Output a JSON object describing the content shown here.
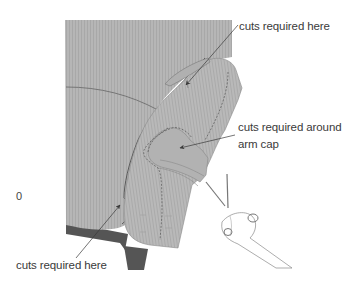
{
  "figure": {
    "colors": {
      "fabric": "#b4b4b4",
      "fabric_stripe": "#a6a6a6",
      "fabric_shadow": "#9c9c9c",
      "leg": "#5a5a5a",
      "seam": "#555555",
      "arrow": "#3a3a3a",
      "text": "#3a3a3a",
      "hand": "#ffffff",
      "hand_outline": "#8a8a8a"
    },
    "annotations": [
      {
        "id": "top",
        "text": "cuts required here"
      },
      {
        "id": "armcap",
        "line1": "cuts required around",
        "line2": "arm cap"
      },
      {
        "id": "bottom",
        "text": "cuts required here"
      }
    ],
    "stray_mark": "0"
  }
}
